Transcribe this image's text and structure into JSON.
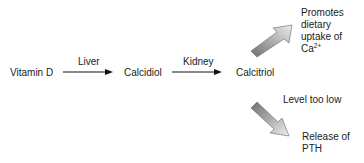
{
  "diagram": {
    "nodes": {
      "vitamin_d": "Vitamin D",
      "calcidiol": "Calcidiol",
      "calcitriol": "Calcitriol",
      "promotes": [
        "Promotes",
        "dietary",
        "uptake of",
        "Ca"
      ],
      "promotes_superscript": "2+",
      "release": [
        "Release of",
        "PTH"
      ]
    },
    "edges": {
      "liver": "Liver",
      "kidney": "Kidney",
      "level_too_low": "Level too low"
    },
    "colors": {
      "text": "#222222",
      "line": "#111111",
      "thick_arrow_dark": "#7a7a7a",
      "thick_arrow_light": "#e6e6e6"
    }
  }
}
